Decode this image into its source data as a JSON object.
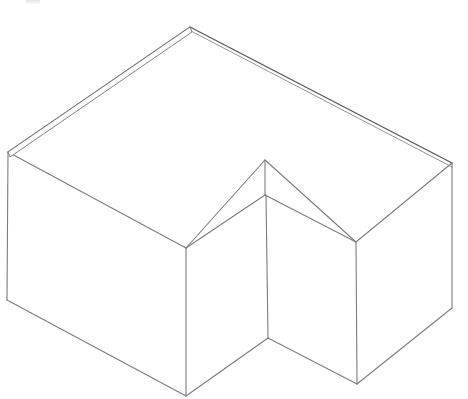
{
  "document": {
    "title": "Isometric L-Shaped Block",
    "description": "Line drawing of an L-shaped (stepped) rectangular solid in isometric projection",
    "background_color": "#ffffff",
    "line_color": "#7c7c7c",
    "line_color_strong": "#5a5a5a",
    "face_fill": "#ffffff",
    "width_px": 468,
    "height_px": 399
  },
  "artifact": {
    "corner_mark_label": ""
  },
  "chart_data": {
    "type": "diagram",
    "projection": "isometric",
    "stroke_color": "#7c7c7c",
    "fill_color": "#ffffff",
    "vertices": {
      "top_apex_back": [
        190,
        27
      ],
      "top_left_corner": [
        8,
        152
      ],
      "top_right_corner": [
        452,
        163
      ],
      "top_inner_notch": [
        265,
        160
      ],
      "top_front_left": [
        186,
        248
      ],
      "top_front_right": [
        356,
        242
      ],
      "notch_floor": [
        265,
        195
      ],
      "front_left_bottom": [
        7,
        300
      ],
      "front_mid_bottom": [
        186,
        396
      ],
      "notch_bottom": [
        268,
        338
      ],
      "front_right_bottom": [
        357,
        384
      ],
      "right_bottom": [
        452,
        308
      ]
    },
    "faces": [
      {
        "name": "top-face-l-shape",
        "vertex_keys": [
          "top_apex_back",
          "top_right_corner",
          "top_front_right",
          "top_inner_notch",
          "top_front_left",
          "top_left_corner"
        ]
      },
      {
        "name": "front-left-face",
        "vertex_keys": [
          "top_left_corner",
          "top_front_left",
          "front_mid_bottom",
          "front_left_bottom"
        ]
      },
      {
        "name": "notch-left-face",
        "vertex_keys": [
          "top_front_left",
          "notch_floor",
          "notch_bottom",
          "front_mid_bottom"
        ]
      },
      {
        "name": "notch-right-face",
        "vertex_keys": [
          "notch_floor",
          "top_front_right",
          "front_right_bottom",
          "notch_bottom"
        ]
      },
      {
        "name": "front-right-face",
        "vertex_keys": [
          "top_front_right",
          "top_right_corner",
          "right_bottom",
          "front_right_bottom"
        ]
      }
    ],
    "edge_count": 18,
    "face_count": 5
  }
}
